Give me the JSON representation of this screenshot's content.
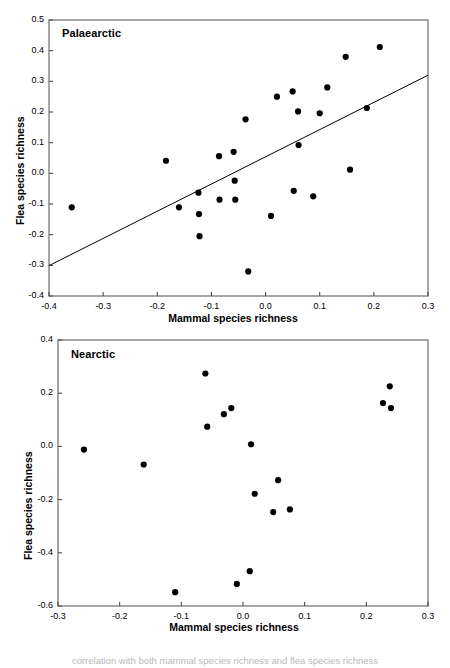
{
  "figure": {
    "caption_cut_off": "correlation with both mammal species richness and flea species richness"
  },
  "chart_data": [
    {
      "type": "scatter",
      "title": "Palaearctic",
      "xlabel": "Mammal species richness",
      "ylabel": "Flea species richness",
      "xlim": [
        -0.4,
        0.3
      ],
      "ylim": [
        -0.4,
        0.5
      ],
      "xticks": [
        -0.4,
        -0.3,
        -0.2,
        -0.1,
        0.0,
        0.1,
        0.2,
        0.3
      ],
      "xticklabels": [
        "-0.4",
        "-0.3",
        "-0.2",
        "-0.1",
        "0.0",
        "0.1",
        "0.2",
        "0.3"
      ],
      "yticks": [
        -0.4,
        -0.3,
        -0.2,
        -0.1,
        0.0,
        0.1,
        0.2,
        0.3,
        0.4,
        0.5
      ],
      "yticklabels": [
        "-0.4",
        "-0.3",
        "-0.2",
        "-0.1",
        "0.0",
        "0.1",
        "0.2",
        "0.3",
        "0.4",
        "0.5"
      ],
      "grid": false,
      "legend": "none",
      "marker": "filled-circle",
      "marker_color": "#000000",
      "points": [
        {
          "x": -0.358,
          "y": -0.111
        },
        {
          "x": -0.184,
          "y": 0.041
        },
        {
          "x": -0.16,
          "y": -0.111
        },
        {
          "x": -0.124,
          "y": -0.063
        },
        {
          "x": -0.123,
          "y": -0.133
        },
        {
          "x": -0.122,
          "y": -0.205
        },
        {
          "x": -0.086,
          "y": 0.056
        },
        {
          "x": -0.085,
          "y": -0.086
        },
        {
          "x": -0.059,
          "y": 0.07
        },
        {
          "x": -0.057,
          "y": -0.024
        },
        {
          "x": -0.056,
          "y": -0.086
        },
        {
          "x": -0.037,
          "y": 0.176
        },
        {
          "x": -0.032,
          "y": -0.32
        },
        {
          "x": 0.01,
          "y": -0.139
        },
        {
          "x": 0.021,
          "y": 0.25
        },
        {
          "x": 0.05,
          "y": 0.267
        },
        {
          "x": 0.052,
          "y": -0.057
        },
        {
          "x": 0.06,
          "y": 0.202
        },
        {
          "x": 0.061,
          "y": 0.092
        },
        {
          "x": 0.088,
          "y": -0.075
        },
        {
          "x": 0.1,
          "y": 0.196
        },
        {
          "x": 0.114,
          "y": 0.28
        },
        {
          "x": 0.148,
          "y": 0.38
        },
        {
          "x": 0.156,
          "y": 0.012
        },
        {
          "x": 0.187,
          "y": 0.213
        },
        {
          "x": 0.211,
          "y": 0.412
        }
      ],
      "regression_line": {
        "x_start": -0.4,
        "y_start": -0.301,
        "x_end": 0.3,
        "y_end": 0.32,
        "color": "#000000"
      }
    },
    {
      "type": "scatter",
      "title": "Nearctic",
      "xlabel": "Mammal species richness",
      "ylabel": "Flea species richness",
      "xlim": [
        -0.3,
        0.3
      ],
      "ylim": [
        -0.6,
        0.4
      ],
      "xticks": [
        -0.3,
        -0.2,
        -0.1,
        0.0,
        0.1,
        0.2,
        0.3
      ],
      "xticklabels": [
        "-0.3",
        "-0.2",
        "-0.1",
        "0.0",
        "0.1",
        "0.2",
        "0.3"
      ],
      "yticks": [
        -0.6,
        -0.4,
        -0.2,
        0.0,
        0.2,
        0.4
      ],
      "yticklabels": [
        "-0.6",
        "-0.4",
        "-0.2",
        "0.0",
        "0.2",
        "0.4"
      ],
      "grid": false,
      "legend": "none",
      "marker": "filled-circle",
      "marker_color": "#000000",
      "points": [
        {
          "x": -0.258,
          "y": -0.012
        },
        {
          "x": -0.161,
          "y": -0.068
        },
        {
          "x": -0.11,
          "y": -0.548
        },
        {
          "x": -0.061,
          "y": 0.274
        },
        {
          "x": -0.058,
          "y": 0.074
        },
        {
          "x": -0.031,
          "y": 0.121
        },
        {
          "x": -0.019,
          "y": 0.144
        },
        {
          "x": -0.01,
          "y": -0.517
        },
        {
          "x": 0.011,
          "y": -0.469
        },
        {
          "x": 0.013,
          "y": 0.008
        },
        {
          "x": 0.019,
          "y": -0.178
        },
        {
          "x": 0.049,
          "y": -0.247
        },
        {
          "x": 0.057,
          "y": -0.127
        },
        {
          "x": 0.076,
          "y": -0.237
        },
        {
          "x": 0.227,
          "y": 0.163
        },
        {
          "x": 0.238,
          "y": 0.226
        },
        {
          "x": 0.24,
          "y": 0.144
        }
      ],
      "regression_line": null
    }
  ]
}
